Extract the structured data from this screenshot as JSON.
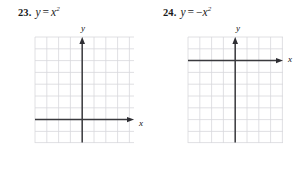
{
  "page": {
    "kind": "textbook-exercise-pair",
    "background_color": "#ffffff",
    "text_color": "#1a1a1a"
  },
  "exercises": [
    {
      "number": "23.",
      "equation": {
        "lhs": "y",
        "operator": "=",
        "negative": "",
        "base": "x",
        "exponent": "2",
        "full_text": "y = x²"
      },
      "graph": {
        "x_axis_label": "x",
        "y_axis_label": "y",
        "grid_columns": 8,
        "grid_rows": 9,
        "cell_size_px": 11.8,
        "origin_col_index": 4,
        "origin_row_index": 7,
        "grid_color": "#d6d6da",
        "border_color": "#cfcfd4",
        "axis_color": "#3a3a3e",
        "arrowheads": [
          "x-positive",
          "y-positive"
        ]
      }
    },
    {
      "number": "24.",
      "equation": {
        "lhs": "y",
        "operator": "=",
        "negative": "−",
        "base": "x",
        "exponent": "2",
        "full_text": "y = −x²"
      },
      "graph": {
        "x_axis_label": "x",
        "y_axis_label": "y",
        "grid_columns": 8,
        "grid_rows": 9,
        "cell_size_px": 11.8,
        "origin_col_index": 4,
        "origin_row_index": 2,
        "grid_color": "#d6d6da",
        "border_color": "#cfcfd4",
        "axis_color": "#3a3a3e",
        "arrowheads": [
          "x-positive",
          "y-positive"
        ]
      }
    }
  ]
}
